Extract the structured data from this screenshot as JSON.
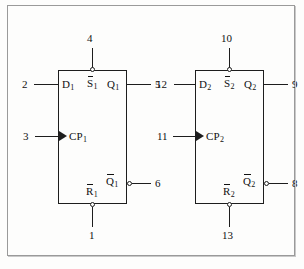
{
  "flipflops": [
    {
      "id": "ff1",
      "ports": {
        "d": {
          "label": "D",
          "sub": "1",
          "overbar": false,
          "pin": "2"
        },
        "clk": {
          "label": "CP",
          "sub": "1",
          "overbar": false,
          "pin": "3"
        },
        "set": {
          "label": "S",
          "sub": "1",
          "overbar": true,
          "pin": "4"
        },
        "reset": {
          "label": "R",
          "sub": "1",
          "overbar": true,
          "pin": "1"
        },
        "q": {
          "label": "Q",
          "sub": "1",
          "overbar": false,
          "pin": "5"
        },
        "qbar": {
          "label": "Q",
          "sub": "1",
          "overbar": true,
          "pin": "6"
        }
      }
    },
    {
      "id": "ff2",
      "ports": {
        "d": {
          "label": "D",
          "sub": "2",
          "overbar": false,
          "pin": "12"
        },
        "clk": {
          "label": "CP",
          "sub": "2",
          "overbar": false,
          "pin": "11"
        },
        "set": {
          "label": "S",
          "sub": "2",
          "overbar": true,
          "pin": "10"
        },
        "reset": {
          "label": "R",
          "sub": "2",
          "overbar": true,
          "pin": "13"
        },
        "q": {
          "label": "Q",
          "sub": "2",
          "overbar": false,
          "pin": "9"
        },
        "qbar": {
          "label": "Q",
          "sub": "2",
          "overbar": true,
          "pin": "8"
        }
      }
    }
  ],
  "colors": {
    "line": "#1d1d1d",
    "frame": "#9a9a9a",
    "background": "#fdfdfc",
    "text": "#111111"
  }
}
